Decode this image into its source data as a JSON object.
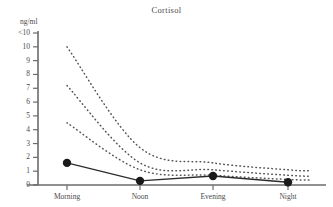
{
  "chart_data": {
    "type": "line",
    "title": "Cortisol",
    "xlabel": "",
    "ylabel": "ng/ml",
    "grid": false,
    "legend": "none",
    "categories": [
      "Morning",
      "Noon",
      "Evening",
      "Night"
    ],
    "y_tick_labels": [
      "<10",
      "10",
      "9",
      "8",
      "7",
      "6",
      "5",
      "4",
      "3",
      "2",
      "1",
      "0"
    ],
    "y_tick_values": [
      11,
      10,
      9,
      8,
      7,
      6,
      5,
      4,
      3,
      2,
      1,
      0
    ],
    "ylim": [
      0,
      11
    ],
    "series": [
      {
        "name": "Median cortisol",
        "style": "solid-with-markers",
        "marker": "filled-circle",
        "values": [
          1.6,
          0.3,
          0.65,
          0.2
        ]
      },
      {
        "name": "Upper reference curve",
        "style": "dotted",
        "values": [
          10.0,
          2.7,
          1.6,
          1.1
        ]
      },
      {
        "name": "Middle reference curve",
        "style": "dotted",
        "values": [
          7.2,
          1.6,
          1.1,
          0.7
        ]
      },
      {
        "name": "Lower reference curve",
        "style": "dotted",
        "values": [
          4.5,
          1.1,
          0.7,
          0.4
        ]
      }
    ],
    "colors": {
      "axis": "#6b6b6b",
      "solid_line": "#2b2b2b",
      "marker": "#1a1a1a",
      "dotted_line": "#555555",
      "text": "#4a4a4a",
      "background": "#ffffff"
    }
  }
}
